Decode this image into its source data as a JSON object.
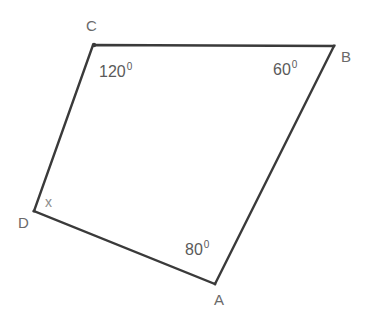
{
  "figure": {
    "kind": "geometry-diagram",
    "shape": "quadrilateral",
    "name": "ABCD",
    "background_color": "#ffffff",
    "stroke_color": "#3a3a3a",
    "text_color": "#5a5a5a",
    "unknown_text_color": "#8d8d8d"
  },
  "vertices": [
    {
      "id": "C",
      "label": "C",
      "x": 93,
      "y": 45
    },
    {
      "id": "B",
      "label": "B",
      "x": 334,
      "y": 46
    },
    {
      "id": "A",
      "label": "A",
      "x": 215,
      "y": 284
    },
    {
      "id": "D",
      "label": "D",
      "x": 34,
      "y": 211
    }
  ],
  "edges": [
    {
      "id": "CB",
      "from": "C",
      "to": "B"
    },
    {
      "id": "BA",
      "from": "B",
      "to": "A"
    },
    {
      "id": "AD",
      "from": "A",
      "to": "D"
    },
    {
      "id": "DC",
      "from": "D",
      "to": "C"
    }
  ],
  "angles": [
    {
      "at": "C",
      "value": "120",
      "degree_symbol": "0",
      "known": true
    },
    {
      "at": "B",
      "value": "60",
      "degree_symbol": "0",
      "known": true
    },
    {
      "at": "A",
      "value": "80",
      "degree_symbol": "0",
      "known": true
    },
    {
      "at": "D",
      "value": "x",
      "degree_symbol": "",
      "known": false
    }
  ],
  "path": {
    "outline": "M 93 45 L 334 46 L 215 284 L 34 211 Z"
  }
}
